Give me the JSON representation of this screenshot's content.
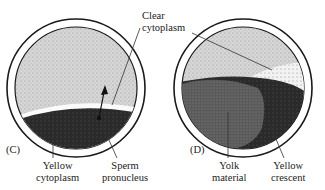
{
  "panels": [
    {
      "id": "C",
      "panel_label": "(C)",
      "labels": {
        "yellow_cytoplasm": [
          "Yellow",
          "cytoplasm"
        ],
        "sperm_pronucleus": [
          "Sperm",
          "pronucleus"
        ]
      }
    },
    {
      "id": "D",
      "panel_label": "(D)",
      "labels": {
        "yolk_material": [
          "Yolk",
          "material"
        ],
        "yellow_crescent": [
          "Yellow",
          "crescent"
        ]
      }
    }
  ],
  "shared_labels": {
    "clear_cytoplasm": [
      "Clear",
      "cytoplasm"
    ]
  },
  "colors": {
    "outline": "#1a1a1a",
    "light_stipple": "#c9c9c9",
    "dark_region": "#2b2b2b",
    "yolk": "#555555"
  }
}
